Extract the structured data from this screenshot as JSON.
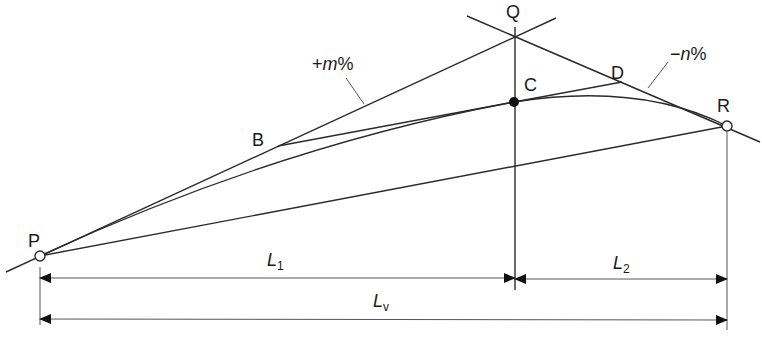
{
  "diagram": {
    "points": {
      "P": {
        "label": "P",
        "x": 40,
        "y": 256,
        "marker": "open-circle"
      },
      "B": {
        "label": "B",
        "x": 278,
        "y": 146
      },
      "Q": {
        "label": "Q",
        "x": 516,
        "y": 37
      },
      "C": {
        "label": "C",
        "x": 514,
        "y": 102,
        "marker": "filled-circle"
      },
      "D": {
        "label": "D",
        "x": 622,
        "y": 82
      },
      "R": {
        "label": "R",
        "x": 727,
        "y": 126,
        "marker": "open-circle"
      }
    },
    "grade_labels": {
      "up": {
        "sign": "+",
        "var": "m",
        "unit": "%"
      },
      "down": {
        "sign": "−",
        "var": "n",
        "unit": "%"
      }
    },
    "dimensions": {
      "L1": {
        "var": "L",
        "sub": "1"
      },
      "L2": {
        "var": "L",
        "sub": "2"
      },
      "Lv": {
        "var": "L",
        "sub": "v"
      }
    },
    "colors": {
      "line": "#2a2a2a",
      "dimension": "#555555",
      "background": "#ffffff"
    }
  }
}
